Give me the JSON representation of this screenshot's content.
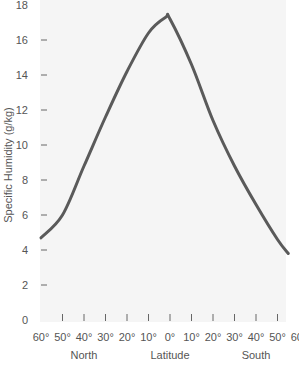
{
  "chart_data": {
    "type": "line",
    "title": "",
    "xlabel": "Latitude",
    "ylabel": "Specific Humidity (g/kg)",
    "x_group_labels": {
      "left": "North",
      "center": "Latitude",
      "right": "South"
    },
    "x_tick_labels": [
      "60°",
      "50°",
      "40°",
      "30°",
      "20°",
      "10°",
      "0°",
      "10°",
      "20°",
      "30°",
      "40°",
      "50°",
      "60°"
    ],
    "x_tick_values": [
      60,
      50,
      40,
      30,
      20,
      10,
      0,
      -10,
      -20,
      -30,
      -40,
      -50,
      -60
    ],
    "y_tick_labels": [
      "0",
      "2",
      "4",
      "6",
      "8",
      "10",
      "12",
      "14",
      "16",
      "18"
    ],
    "ylim": [
      0,
      18
    ],
    "xlim_note": "60°N to 60°S (north positive)",
    "grid": false,
    "legend": null,
    "series": [
      {
        "name": "Specific Humidity",
        "color": "#555555",
        "x": [
          60,
          50,
          40,
          30,
          20,
          10,
          2,
          0,
          -10,
          -20,
          -30,
          -40,
          -50,
          -55
        ],
        "values": [
          4.7,
          6.0,
          8.8,
          11.6,
          14.2,
          16.4,
          17.3,
          17.2,
          14.6,
          11.4,
          8.8,
          6.6,
          4.6,
          3.8
        ]
      }
    ]
  },
  "colors": {
    "plot_background": "#f5f5f5",
    "line": "#5a5a5a",
    "text": "#555555"
  }
}
